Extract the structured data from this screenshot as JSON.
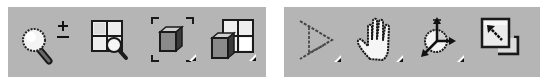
{
  "colors": {
    "background": "#ffffff",
    "toolbar_bg": "#b5b5b5",
    "icon_outline": "#1a1a1a",
    "icon_fill_light": "#f2f2f2",
    "icon_fill_mid": "#8a8a8a",
    "icon_fill_dark": "#555555"
  },
  "toolbars": [
    {
      "id": "view-zoom-tools",
      "tools": [
        {
          "name": "zoom",
          "icon": "magnifier-plus-minus-icon",
          "has_flyout": false
        },
        {
          "name": "zoom-all",
          "icon": "grid-magnifier-icon",
          "has_flyout": false
        },
        {
          "name": "zoom-extents",
          "icon": "cube-in-brackets-icon",
          "has_flyout": true
        },
        {
          "name": "zoom-extents-all",
          "icon": "cube-over-grid-icon",
          "has_flyout": true
        }
      ]
    },
    {
      "id": "view-navigation-tools",
      "tools": [
        {
          "name": "field-of-view",
          "icon": "field-of-view-triangle-icon",
          "has_flyout": true
        },
        {
          "name": "pan",
          "icon": "hand-pan-icon",
          "has_flyout": true
        },
        {
          "name": "orbit",
          "icon": "orbit-axes-icon",
          "has_flyout": true
        },
        {
          "name": "maximize-viewport-toggle",
          "icon": "maximize-window-arrow-icon",
          "has_flyout": false
        }
      ]
    }
  ]
}
